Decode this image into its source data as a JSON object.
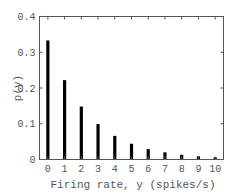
{
  "chart_data": {
    "type": "bar",
    "title": "",
    "xlabel": "Firing rate, y (spikes/s)",
    "ylabel": "p(y)",
    "categories": [
      "0",
      "1",
      "2",
      "3",
      "4",
      "5",
      "6",
      "7",
      "8",
      "9",
      "10"
    ],
    "values": [
      0.333,
      0.222,
      0.148,
      0.099,
      0.066,
      0.044,
      0.029,
      0.02,
      0.013,
      0.009,
      0.006
    ],
    "ylim": [
      0,
      0.4
    ],
    "yticks": [
      "0",
      "0.1",
      "0.2",
      "0.3",
      "0.4"
    ],
    "ytick_values": [
      0,
      0.1,
      0.2,
      0.3,
      0.4
    ],
    "xlim": [
      -0.5,
      10.5
    ],
    "grid": false,
    "legend": null,
    "box": true,
    "colors": {
      "bar": "#000000",
      "axis": "#555555",
      "text": "#555555"
    }
  }
}
